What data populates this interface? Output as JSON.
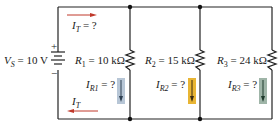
{
  "source": {
    "label_var": "V",
    "label_sub": "S",
    "label_value": " = 10 V",
    "plus": "+",
    "minus": "−"
  },
  "total_current": {
    "top_var": "I",
    "top_sub": "T",
    "top_value": " = ?",
    "bottom_var": "I",
    "bottom_sub": "T",
    "arrow_color": "#c0392b"
  },
  "resistors": [
    {
      "var": "R",
      "sub": "1",
      "value": " = 10 kΩ",
      "current_var": "I",
      "current_sub": "R1",
      "current_value": " = ?",
      "highlight": "#b7c6d6"
    },
    {
      "var": "R",
      "sub": "2",
      "value": " = 15 kΩ",
      "current_var": "I",
      "current_sub": "R2",
      "current_value": " = ?",
      "highlight": "#e8b534"
    },
    {
      "var": "R",
      "sub": "3",
      "value": " = 24 kΩ",
      "current_var": "I",
      "current_sub": "R3",
      "current_value": " = ?",
      "highlight": "#9fb5a8"
    }
  ]
}
